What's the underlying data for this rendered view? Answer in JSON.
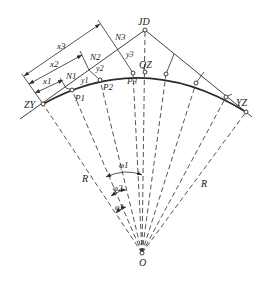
{
  "diagram": {
    "colors": {
      "line": "#2a2a2a",
      "background": "#ffffff"
    },
    "points": {
      "JD": {
        "label": "JD",
        "x": 145,
        "y": 30
      },
      "ZY": {
        "label": "ZY",
        "x": 43,
        "y": 104
      },
      "YZ": {
        "label": "YZ",
        "x": 246,
        "y": 112
      },
      "QZ": {
        "label": "QZ",
        "x": 143,
        "y": 72
      },
      "O": {
        "label": "O",
        "x": 142,
        "y": 253
      },
      "P1": {
        "label": "P1",
        "x": 72,
        "y": 90
      },
      "P2": {
        "label": "P2",
        "x": 100,
        "y": 80
      },
      "P3": {
        "label": "P3",
        "x": 133,
        "y": 73
      }
    },
    "labels": {
      "x1": "x1",
      "x2": "x2",
      "x3": "x3",
      "N1": "N1",
      "N2": "N2",
      "N3": "N3",
      "y1": "y1",
      "y2": "y2",
      "y3": "y3",
      "R_left": "R",
      "R_right": "R",
      "phi1": "φ1",
      "phi2": "φ2",
      "phi3": "φ3",
      "JD": "JD",
      "ZY": "ZY",
      "YZ": "YZ",
      "QZ": "QZ",
      "O": "O",
      "P1": "P1",
      "P2": "P2",
      "P3": "P3"
    }
  }
}
